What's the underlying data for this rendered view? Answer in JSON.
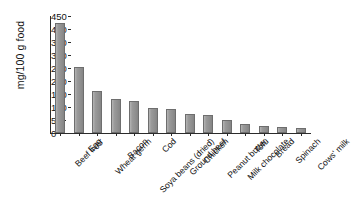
{
  "chart_data": {
    "type": "bar",
    "title": "",
    "xlabel": "",
    "ylabel": "mg/100 g food",
    "ylim": [
      0,
      450
    ],
    "ytick_step": 50,
    "yticks": [
      450,
      400,
      350,
      300,
      250,
      200,
      150,
      100,
      50,
      0
    ],
    "ytick_labels": [
      "450",
      "400",
      "350",
      "300",
      "250",
      "200",
      "150",
      "100",
      "50",
      "0"
    ],
    "grid": false,
    "legend": null,
    "bar_color": "#949494",
    "bar_edge_color": "#6e6e6e",
    "axis_color": "#2b2b2b",
    "categories": [
      "Beef liver",
      "Egg",
      "Wheat germ",
      "Bacon",
      "Soya beans (dried)",
      "Cod",
      "Ground beef",
      "Chicken",
      "Peanut butter",
      "Milk chocolate",
      "Tofu",
      "Bread",
      "Spinach",
      "Cows' milk"
    ],
    "values": [
      425,
      255,
      160,
      130,
      122,
      95,
      92,
      72,
      70,
      50,
      35,
      28,
      25,
      18
    ]
  }
}
